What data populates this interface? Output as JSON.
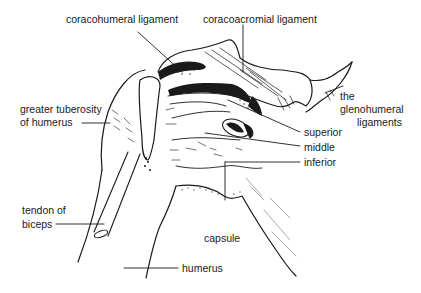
{
  "figure": {
    "line_color": "#1a1a1a",
    "background": "#ffffff"
  },
  "labels": {
    "coracohumeral": "coracohumeral ligament",
    "coracoacromial": "coracoacromial ligament",
    "greater_tuberosity_1": "greater tuberosity",
    "greater_tuberosity_2": "of humerus",
    "glenohumeral_1": "the",
    "glenohumeral_2": "glenohumeral",
    "glenohumeral_3": "ligaments",
    "superior": "superior",
    "middle": "middle",
    "inferior": "inferior",
    "tendon_1": "tendon of",
    "tendon_2": "biceps",
    "capsule": "capsule",
    "humerus": "humerus"
  }
}
